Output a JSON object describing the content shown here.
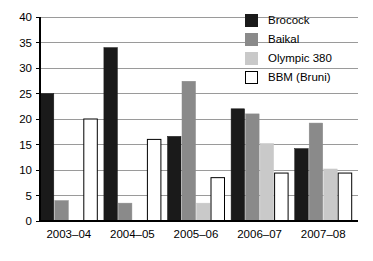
{
  "chart_data": {
    "type": "bar",
    "title": "",
    "subtitle": "",
    "xlabel": "",
    "ylabel": "",
    "categories": [
      "2003–04",
      "2004–05",
      "2005–06",
      "2006–07",
      "2007–08"
    ],
    "series": [
      {
        "name": "Brocock",
        "color": "#1a1a1a",
        "values": [
          25,
          34,
          16.6,
          22,
          14.2
        ]
      },
      {
        "name": "Baikal",
        "color": "#8a8a8a",
        "values": [
          4,
          3.5,
          27.4,
          21,
          19.2
        ]
      },
      {
        "name": "Olympic 380",
        "color": "#c9c9c9",
        "values": [
          0,
          0,
          3.5,
          15.2,
          10.2
        ]
      },
      {
        "name": "BBM (Bruni)",
        "color": "#ffffff",
        "values": [
          20,
          16,
          8.5,
          9.4,
          9.4
        ]
      }
    ],
    "ylim": [
      0,
      40
    ],
    "yticks": [
      0,
      5,
      10,
      15,
      20,
      25,
      30,
      35,
      40
    ],
    "ytick_labels": [
      "0",
      "5",
      "10",
      "15",
      "20",
      "25",
      "30",
      "35",
      "40"
    ],
    "grid": true,
    "grid_axis": "y",
    "legend_position": "top-right"
  },
  "legend": {
    "items": [
      {
        "label": "Brocock",
        "swatch": "black-swatch"
      },
      {
        "label": "Baikal",
        "swatch": "dark-gray-swatch"
      },
      {
        "label": "Olympic 380",
        "swatch": "light-gray-swatch"
      },
      {
        "label": "BBM (Bruni)",
        "swatch": "white-swatch"
      }
    ]
  },
  "colors": {
    "brocock": "#1a1a1a",
    "baikal": "#8a8a8a",
    "olympic": "#c9c9c9",
    "bbm": "#ffffff",
    "axis": "#000000",
    "grid": "#9a9a9a",
    "background": "#ffffff"
  }
}
